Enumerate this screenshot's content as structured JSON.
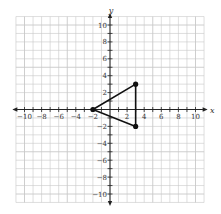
{
  "chart_data": {
    "type": "scatter",
    "title": "",
    "xlabel": "x",
    "ylabel": "y",
    "xlim": [
      -11,
      11
    ],
    "ylim": [
      -11,
      11
    ],
    "grid": true,
    "x_ticks": [
      -10,
      -8,
      -6,
      -4,
      -2,
      2,
      4,
      6,
      8,
      10
    ],
    "y_ticks": [
      -10,
      -8,
      -6,
      -4,
      -2,
      2,
      4,
      6,
      8,
      10
    ],
    "x_tick_labels": [
      "−10",
      "−8",
      "−6",
      "−4",
      "−2",
      "2",
      "4",
      "6",
      "8",
      "10"
    ],
    "y_tick_labels": [
      "−10",
      "−8",
      "−6",
      "−4",
      "−2",
      "2",
      "4",
      "6",
      "8",
      "10"
    ],
    "series": [
      {
        "name": "triangle",
        "closed_polygon": true,
        "points": [
          [
            -2,
            0
          ],
          [
            3,
            3
          ],
          [
            3,
            -2
          ]
        ]
      }
    ]
  },
  "colors": {
    "grid": "#c8c8c8",
    "axis": "#222222",
    "shape": "#111111",
    "background": "#ffffff"
  }
}
